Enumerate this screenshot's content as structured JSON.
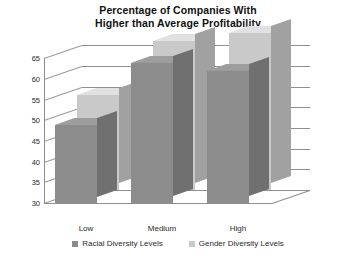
{
  "chart_data": {
    "type": "bar",
    "title": "Percentage of Companies With Higher than Average Profitability",
    "title_line1": "Percentage of Companies With",
    "title_line2": "Higher than Average Profitability",
    "xlabel": "",
    "ylabel": "",
    "ylim": [
      30,
      68
    ],
    "yticks": [
      30,
      35,
      40,
      45,
      50,
      55,
      60,
      65
    ],
    "grid": true,
    "legend_position": "bottom",
    "style": "3d-column",
    "categories": [
      "Low",
      "Medium",
      "High"
    ],
    "series": [
      {
        "name": "Racial Diversity Levels",
        "color": "#8c8c8c",
        "values": [
          49,
          64,
          62
        ]
      },
      {
        "name": "Gender Diversity Levels",
        "color": "#c9c9c9",
        "values": [
          53,
          66,
          68
        ]
      }
    ]
  },
  "legend": {
    "items": [
      {
        "label": "Racial Diversity Levels",
        "color": "#8c8c8c"
      },
      {
        "label": "Gender Diversity Levels",
        "color": "#c9c9c9"
      }
    ]
  }
}
